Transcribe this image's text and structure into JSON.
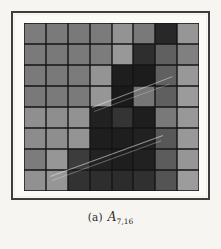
{
  "figure": {
    "caption_label": "(a)",
    "caption_symbol": "A",
    "caption_subscript": "7,16",
    "frame_color": "#3d3d3d",
    "page_background": "#f6f5f1",
    "panel_background": "#fbfaf7",
    "gridline_color": "#141414"
  },
  "chart_data": {
    "type": "heatmap",
    "xlabel": "",
    "ylabel": "",
    "rows": 8,
    "cols": 8,
    "grid": true,
    "legend": "none",
    "colormap": "grayscale",
    "value_range": [
      0,
      255
    ],
    "row_labels": [
      "1",
      "2",
      "3",
      "4",
      "5",
      "6",
      "7",
      "8"
    ],
    "col_labels": [
      "1",
      "2",
      "3",
      "4",
      "5",
      "6",
      "7",
      "8"
    ],
    "values": [
      [
        124,
        122,
        121,
        123,
        147,
        121,
        40,
        150
      ],
      [
        122,
        121,
        122,
        124,
        152,
        46,
        96,
        128
      ],
      [
        122,
        121,
        123,
        148,
        30,
        28,
        96,
        152
      ],
      [
        121,
        122,
        122,
        150,
        26,
        118,
        95,
        155
      ],
      [
        143,
        142,
        146,
        33,
        52,
        30,
        121,
        152
      ],
      [
        140,
        142,
        148,
        30,
        30,
        33,
        88,
        152
      ],
      [
        124,
        150,
        60,
        34,
        30,
        33,
        92,
        150
      ],
      [
        145,
        150,
        50,
        46,
        44,
        48,
        84,
        156
      ]
    ],
    "cell_colors": [
      [
        "#7c7c7c",
        "#7a7a7a",
        "#797979",
        "#7b7b7b",
        "#939393",
        "#797979",
        "#282828",
        "#969696"
      ],
      [
        "#7a7a7a",
        "#797979",
        "#7a7a7a",
        "#7c7c7c",
        "#989898",
        "#2e2e2e",
        "#606060",
        "#808080"
      ],
      [
        "#7a7a7a",
        "#797979",
        "#7b7b7b",
        "#949494",
        "#1e1e1e",
        "#1c1c1c",
        "#606060",
        "#989898"
      ],
      [
        "#797979",
        "#7a7a7a",
        "#7a7a7a",
        "#969696",
        "#1a1a1a",
        "#767676",
        "#5f5f5f",
        "#9b9b9b"
      ],
      [
        "#8f8f8f",
        "#8e8e8e",
        "#929292",
        "#212121",
        "#343434",
        "#1e1e1e",
        "#797979",
        "#989898"
      ],
      [
        "#8c8c8c",
        "#8e8e8e",
        "#949494",
        "#1e1e1e",
        "#1e1e1e",
        "#212121",
        "#585858",
        "#989898"
      ],
      [
        "#7c7c7c",
        "#969696",
        "#3c3c3c",
        "#222222",
        "#1e1e1e",
        "#212121",
        "#5c5c5c",
        "#969696"
      ],
      [
        "#919191",
        "#969696",
        "#323232",
        "#2e2e2e",
        "#2c2c2c",
        "#303030",
        "#545454",
        "#9c9c9c"
      ]
    ],
    "annotations": [
      {
        "name": "diagonal-streak-upper",
        "description": "faint light diagonal line across dark blocks, upper region"
      },
      {
        "name": "diagonal-streak-lower",
        "description": "faint light diagonal line across dark blocks, lower region"
      }
    ]
  }
}
